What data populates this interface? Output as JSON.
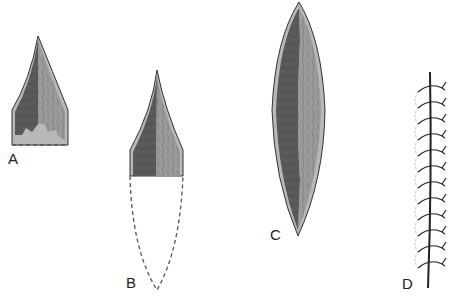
{
  "figure": {
    "panels": [
      {
        "id": "A",
        "label": "A",
        "description": "Partially destroyed leaf-shaped element with irregular lower margin; dashed line marks missing base"
      },
      {
        "id": "B",
        "label": "B",
        "description": "Pointed upper half with dashed outline showing missing lower portion"
      },
      {
        "id": "C",
        "label": "C",
        "description": "Complete elongated spindle-shaped element with dark left half and light right half"
      },
      {
        "id": "D",
        "label": "D",
        "description": "Vertical axis with repeated looping strands and branching tips"
      }
    ]
  },
  "colors": {
    "dark_half": "#5a5a5a",
    "light_half": "#9a9a9a",
    "rim": "#b8b8b8",
    "outline": "#333333",
    "dashed": "#555555"
  }
}
